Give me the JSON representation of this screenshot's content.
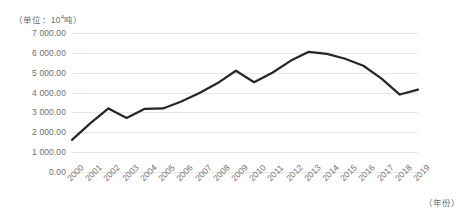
{
  "chart_data": {
    "type": "line",
    "title": "",
    "unit_note": "（单位：10⁴吨）",
    "unit_prefix": "（单位：10",
    "unit_exponent": "4",
    "unit_suffix": "吨）",
    "xlabel": "（年份）",
    "ylabel": "",
    "grid": "horizontal",
    "legend": "none",
    "line_color": "#262626",
    "grid_color": "#e8e8e8",
    "text_color": "#6e6e6e",
    "ylim": [
      0,
      7000
    ],
    "ytick_labels": [
      "7 000.00",
      "6 000.00",
      "5 000.00",
      "4 000.00",
      "3 000.00",
      "2 000.00",
      "1 000.00",
      "0.00"
    ],
    "ytick_values": [
      7000,
      6000,
      5000,
      4000,
      3000,
      2000,
      1000,
      0
    ],
    "categories": [
      "2000",
      "2001",
      "2002",
      "2003",
      "2004",
      "2005",
      "2006",
      "2007",
      "2008",
      "2009",
      "2010",
      "2011",
      "2012",
      "2013",
      "2014",
      "2015",
      "2016",
      "2017",
      "2018",
      "2019"
    ],
    "values": [
      1620,
      2450,
      3200,
      2720,
      3180,
      3200,
      3550,
      3980,
      4480,
      5100,
      4520,
      5000,
      5600,
      6050,
      5950,
      5700,
      5350,
      4700,
      3900,
      4150
    ]
  }
}
